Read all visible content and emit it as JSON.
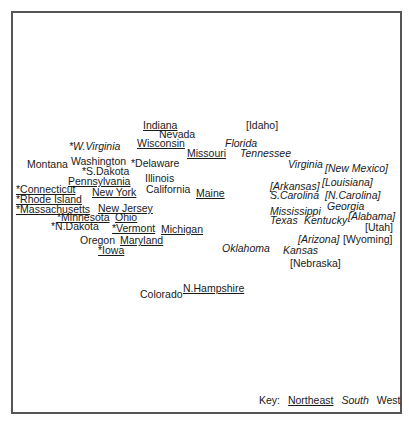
{
  "chart_data": {
    "type": "scatter",
    "title": "",
    "xlabel": "",
    "ylabel": "",
    "grid": false,
    "legend_position": "bottom-right",
    "legend": {
      "prefix": "Key:",
      "entries": [
        {
          "label": "Northeast",
          "style": "underline"
        },
        {
          "label": "South",
          "style": "italic"
        },
        {
          "label": "West",
          "style": "plain"
        }
      ]
    },
    "points": [
      {
        "label": "Indiana",
        "region": "Northeast",
        "x": 143,
        "y": 120
      },
      {
        "label": "Nevada",
        "region": "West",
        "x": 159,
        "y": 129
      },
      {
        "label": "[Idaho]",
        "region": "West",
        "x": 246,
        "y": 120
      },
      {
        "label": "Wisconsin",
        "region": "Northeast",
        "x": 137,
        "y": 138
      },
      {
        "label": "Florida",
        "region": "South",
        "x": 225,
        "y": 138
      },
      {
        "label": "*W.Virginia",
        "region": "South",
        "x": 69,
        "y": 141
      },
      {
        "label": "Missouri",
        "region": "Northeast",
        "x": 187,
        "y": 148
      },
      {
        "label": "Tennessee",
        "region": "South",
        "x": 240,
        "y": 148
      },
      {
        "label": "Montana",
        "region": "West",
        "x": 27,
        "y": 159
      },
      {
        "label": "Washington",
        "region": "West",
        "x": 71,
        "y": 156
      },
      {
        "label": "*Delaware",
        "region": "West",
        "x": 131,
        "y": 158
      },
      {
        "label": "Virginia",
        "region": "South",
        "x": 288,
        "y": 159
      },
      {
        "label": "[New Mexico]",
        "region": "South",
        "x": 325,
        "y": 163
      },
      {
        "label": "*S.Dakota",
        "region": "West",
        "x": 82,
        "y": 166
      },
      {
        "label": "Pennsylvania",
        "region": "Northeast",
        "x": 68,
        "y": 176
      },
      {
        "label": "Illinois",
        "region": "West",
        "x": 145,
        "y": 173
      },
      {
        "label": "[Louisiana]",
        "region": "South",
        "x": 322,
        "y": 177
      },
      {
        "label": "[Arkansas]",
        "region": "South",
        "x": 270,
        "y": 181
      },
      {
        "label": "*Connecticut",
        "region": "Northeast",
        "x": 16,
        "y": 184
      },
      {
        "label": "New York",
        "region": "Northeast",
        "x": 92,
        "y": 187
      },
      {
        "label": "California",
        "region": "West",
        "x": 146,
        "y": 184
      },
      {
        "label": "Maine",
        "region": "Northeast",
        "x": 196,
        "y": 188
      },
      {
        "label": "S.Carolina",
        "region": "South",
        "x": 270,
        "y": 190
      },
      {
        "label": "[N.Carolina]",
        "region": "South",
        "x": 325,
        "y": 190
      },
      {
        "label": "*Rhode Island",
        "region": "Northeast",
        "x": 16,
        "y": 194
      },
      {
        "label": "Georgia",
        "region": "South",
        "x": 327,
        "y": 201
      },
      {
        "label": "*Massachusetts",
        "region": "Northeast",
        "x": 16,
        "y": 204
      },
      {
        "label": "New Jersey",
        "region": "Northeast",
        "x": 98,
        "y": 203
      },
      {
        "label": "Mississippi",
        "region": "South",
        "x": 270,
        "y": 206
      },
      {
        "label": "*Minnesota",
        "region": "Northeast",
        "x": 57,
        "y": 212
      },
      {
        "label": "Ohio",
        "region": "Northeast",
        "x": 115,
        "y": 212
      },
      {
        "label": "[Alabama]",
        "region": "South",
        "x": 348,
        "y": 211
      },
      {
        "label": "Texas",
        "region": "South",
        "x": 270,
        "y": 215
      },
      {
        "label": "Kentucky",
        "region": "South",
        "x": 304,
        "y": 215
      },
      {
        "label": "*N.Dakota",
        "region": "West",
        "x": 51,
        "y": 221
      },
      {
        "label": "*Vermont",
        "region": "Northeast",
        "x": 112,
        "y": 223
      },
      {
        "label": "Michigan",
        "region": "Northeast",
        "x": 161,
        "y": 224
      },
      {
        "label": "[Utah]",
        "region": "West",
        "x": 365,
        "y": 222
      },
      {
        "label": "[Arizona]",
        "region": "South",
        "x": 298,
        "y": 234
      },
      {
        "label": "[Wyoming]",
        "region": "West",
        "x": 343,
        "y": 234
      },
      {
        "label": "Oregon",
        "region": "West",
        "x": 80,
        "y": 235
      },
      {
        "label": "Maryland",
        "region": "Northeast",
        "x": 120,
        "y": 235
      },
      {
        "label": "*Iowa",
        "region": "Northeast",
        "x": 98,
        "y": 245
      },
      {
        "label": "Oklahoma",
        "region": "South",
        "x": 222,
        "y": 243
      },
      {
        "label": "Kansas",
        "region": "South",
        "x": 283,
        "y": 245
      },
      {
        "label": "[Nebraska]",
        "region": "West",
        "x": 290,
        "y": 258
      },
      {
        "label": "Colorado",
        "region": "West",
        "x": 140,
        "y": 289
      },
      {
        "label": "N.Hampshire",
        "region": "Northeast",
        "x": 183,
        "y": 283
      }
    ]
  }
}
